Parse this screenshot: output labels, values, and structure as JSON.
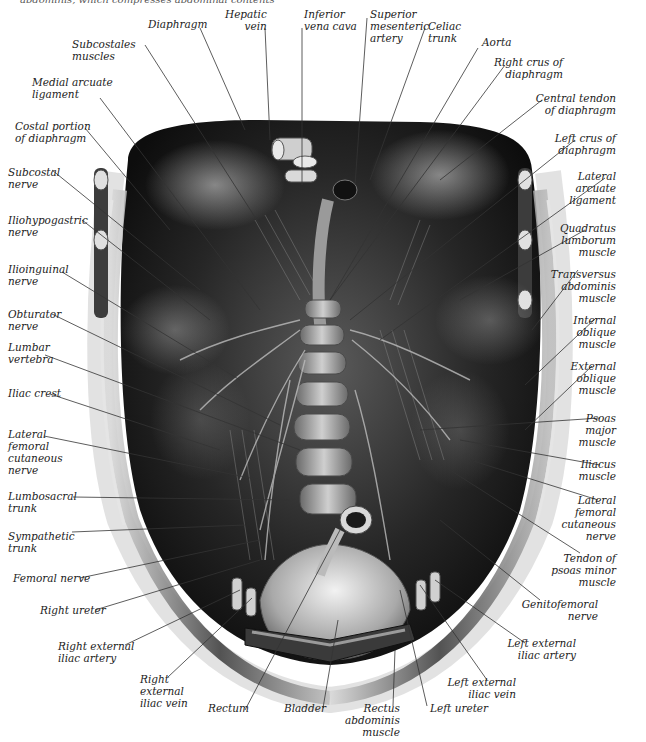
{
  "caption": "abdominis, which compresses abdominal contents",
  "figure": {
    "type": "anatomical illustration",
    "colors": {
      "background": "#ffffff",
      "ink": "#222222",
      "tissue_dark": "#1a1a1a",
      "tissue_mid": "#6e6e6e",
      "tissue_light": "#d8d8d8"
    }
  },
  "labels": {
    "top": [
      {
        "id": "diaphragm",
        "text": "Diaphragm"
      },
      {
        "id": "hepatic_vein",
        "text": "Hepatic\nvein"
      },
      {
        "id": "inferior_vena_cava",
        "text": "Inferior\nvena cava"
      },
      {
        "id": "superior_mesenteric_artery",
        "text": "Superior\nmesenteric\nartery"
      },
      {
        "id": "celiac_trunk",
        "text": "Celiac\ntrunk"
      },
      {
        "id": "aorta",
        "text": "Aorta"
      },
      {
        "id": "subcostales_muscles",
        "text": "Subcostales\nmuscles"
      }
    ],
    "left": [
      {
        "id": "medial_arcuate_ligament",
        "text": "Medial arcuate\nligament"
      },
      {
        "id": "costal_portion_diaphragm",
        "text": "Costal portion\nof diaphragm"
      },
      {
        "id": "subcostal_nerve",
        "text": "Subcostal\nnerve"
      },
      {
        "id": "iliohypogastric_nerve",
        "text": "Iliohypogastric\nnerve"
      },
      {
        "id": "ilioinguinal_nerve",
        "text": "Ilioinguinal\nnerve"
      },
      {
        "id": "obturator_nerve",
        "text": "Obturator\nnerve"
      },
      {
        "id": "lumbar_vertebra",
        "text": "Lumbar\nvertebra"
      },
      {
        "id": "iliac_crest",
        "text": "Iliac crest"
      },
      {
        "id": "lateral_femoral_cutaneous_nerve_left",
        "text": "Lateral\nfemoral\ncutaneous\nnerve"
      },
      {
        "id": "lumbosacral_trunk",
        "text": "Lumbosacral\ntrunk"
      },
      {
        "id": "sympathetic_trunk",
        "text": "Sympathetic\ntrunk"
      },
      {
        "id": "femoral_nerve",
        "text": "Femoral nerve"
      },
      {
        "id": "right_ureter",
        "text": "Right ureter"
      },
      {
        "id": "right_external_iliac_artery",
        "text": "Right external\niliac artery"
      }
    ],
    "right": [
      {
        "id": "right_crus",
        "text": "Right crus of\ndiaphragm"
      },
      {
        "id": "central_tendon",
        "text": "Central tendon\nof diaphragm"
      },
      {
        "id": "left_crus",
        "text": "Left crus of\ndiaphragm"
      },
      {
        "id": "lateral_arcuate_ligament",
        "text": "Lateral\narcuate\nligament"
      },
      {
        "id": "quadratus_lumborum",
        "text": "Quadratus\nlumborum\nmuscle"
      },
      {
        "id": "transversus_abdominis",
        "text": "Transversus\nabdominis\nmuscle"
      },
      {
        "id": "internal_oblique",
        "text": "Internal\noblique\nmuscle"
      },
      {
        "id": "external_oblique",
        "text": "External\noblique\nmuscle"
      },
      {
        "id": "psoas_major",
        "text": "Psoas\nmajor\nmuscle"
      },
      {
        "id": "iliacus",
        "text": "Iliacus\nmuscle"
      },
      {
        "id": "lateral_femoral_cutaneous_nerve_right",
        "text": "Lateral\nfemoral\ncutaneous\nnerve"
      },
      {
        "id": "tendon_psoas_minor",
        "text": "Tendon of\npsoas minor\nmuscle"
      },
      {
        "id": "genitofemoral_nerve",
        "text": "Genitofemoral\nnerve"
      },
      {
        "id": "left_external_iliac_artery",
        "text": "Left external\niliac artery"
      },
      {
        "id": "left_external_iliac_vein",
        "text": "Left external\niliac vein"
      }
    ],
    "bottom": [
      {
        "id": "right_external_iliac_vein",
        "text": "Right\nexternal\niliac vein"
      },
      {
        "id": "rectum",
        "text": "Rectum"
      },
      {
        "id": "bladder",
        "text": "Bladder"
      },
      {
        "id": "rectus_abdominis",
        "text": "Rectus\nabdominis\nmuscle"
      },
      {
        "id": "left_ureter",
        "text": "Left ureter"
      }
    ]
  }
}
